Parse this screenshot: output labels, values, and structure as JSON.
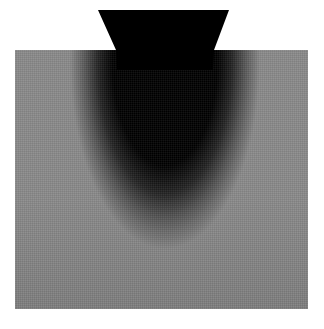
{
  "figure": {
    "probe": {
      "shape": "trapezoid",
      "top_left_x": 98,
      "top_right_x": 229,
      "top_y": 10,
      "bottom_left_x": 116,
      "bottom_right_x": 214,
      "bottom_y": 50,
      "color": "#000000"
    },
    "medium": {
      "shape": "square",
      "x": 15,
      "y": 50,
      "width": 293,
      "height": 259,
      "base_color": "#8a8a8a"
    },
    "plume": {
      "color": "#000000",
      "center_x": 165,
      "extends_to_y": 240
    },
    "halo_color": "#c8c8c8",
    "background": "#ffffff"
  }
}
